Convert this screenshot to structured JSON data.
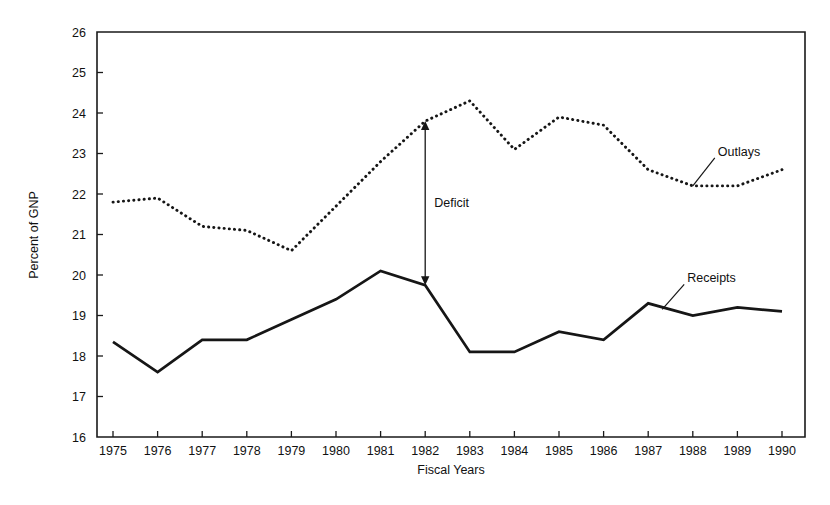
{
  "chart_data": {
    "type": "line",
    "title": "",
    "xlabel": "Fiscal Years",
    "ylabel": "Percent of GNP",
    "xlim": [
      1975,
      1990
    ],
    "ylim": [
      16,
      26
    ],
    "grid": false,
    "legend_position": "inline-annotations",
    "categories": [
      1975,
      1976,
      1977,
      1978,
      1979,
      1980,
      1981,
      1982,
      1983,
      1984,
      1985,
      1986,
      1987,
      1988,
      1989,
      1990
    ],
    "x_tick_labels": [
      "1975",
      "1976",
      "1977",
      "1978",
      "1979",
      "1980",
      "1981",
      "1982",
      "1983",
      "1984",
      "1985",
      "1986",
      "1987",
      "1988",
      "1989",
      "1990"
    ],
    "y_tick_labels": [
      "16",
      "17",
      "18",
      "19",
      "20",
      "21",
      "22",
      "23",
      "24",
      "25",
      "26"
    ],
    "y_ticks": [
      16,
      17,
      18,
      19,
      20,
      21,
      22,
      23,
      24,
      25,
      26
    ],
    "series": [
      {
        "name": "Outlays",
        "style": "dotted",
        "values": [
          21.8,
          21.9,
          21.2,
          21.1,
          20.6,
          21.7,
          22.8,
          23.8,
          24.3,
          23.1,
          23.9,
          23.7,
          22.6,
          22.2,
          22.2,
          22.6
        ]
      },
      {
        "name": "Receipts",
        "style": "solid",
        "values": [
          18.35,
          17.6,
          18.4,
          18.4,
          18.9,
          19.4,
          20.1,
          19.75,
          18.1,
          18.1,
          18.6,
          18.4,
          19.3,
          19.0,
          19.2,
          19.1
        ]
      }
    ],
    "annotations": [
      {
        "text": "Deficit",
        "type": "double-arrow",
        "x": 1982,
        "y_top": 23.8,
        "y_bottom": 19.75
      },
      {
        "text": "Outlays",
        "type": "leader-label",
        "x": 1988.0,
        "y": 22.2
      },
      {
        "text": "Receipts",
        "type": "leader-label",
        "x": 1987.0,
        "y": 19.3
      }
    ]
  },
  "colors": {
    "line": "#161616",
    "axis": "#1a1a1a",
    "background": "#ffffff"
  }
}
